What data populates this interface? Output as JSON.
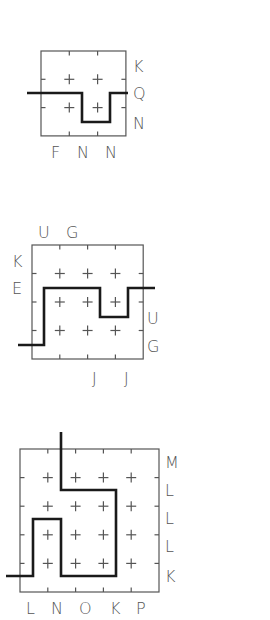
{
  "puzzles": [
    {
      "id": "puzzle-1",
      "grid": {
        "x": 41,
        "y": 51,
        "cols": 3,
        "rows": 3,
        "cell_w": 28.3,
        "cell_h": 28.3
      },
      "path": [
        [
          27,
          93
        ],
        [
          82,
          93
        ],
        [
          82,
          122
        ],
        [
          110,
          122
        ],
        [
          110,
          93
        ],
        [
          128,
          93
        ]
      ],
      "labels": {
        "top": [],
        "left": [],
        "right": [
          {
            "text": "K",
            "x": 133,
            "y": 72
          },
          {
            "text": "Q",
            "x": 133,
            "y": 99
          },
          {
            "text": "N",
            "x": 133,
            "y": 129
          }
        ],
        "bottom": [
          {
            "text": "F",
            "x": 51,
            "y": 158
          },
          {
            "text": "N",
            "x": 77,
            "y": 158
          },
          {
            "text": "N",
            "x": 105,
            "y": 158
          }
        ]
      }
    },
    {
      "id": "puzzle-2",
      "grid": {
        "x": 32,
        "y": 245,
        "cols": 4,
        "rows": 4,
        "cell_w": 27.8,
        "cell_h": 28.5
      },
      "path": [
        [
          18,
          345
        ],
        [
          44,
          345
        ],
        [
          44,
          288
        ],
        [
          100,
          288
        ],
        [
          100,
          317
        ],
        [
          128,
          317
        ],
        [
          128,
          288
        ],
        [
          155,
          288
        ]
      ],
      "labels": {
        "top": [
          {
            "text": "U",
            "x": 38,
            "y": 238
          },
          {
            "text": "G",
            "x": 66,
            "y": 238
          }
        ],
        "left": [
          {
            "text": "K",
            "x": 12,
            "y": 267
          },
          {
            "text": "E",
            "x": 12,
            "y": 294
          }
        ],
        "right": [
          {
            "text": "U",
            "x": 147,
            "y": 324
          },
          {
            "text": "G",
            "x": 147,
            "y": 352
          }
        ],
        "bottom": [
          {
            "text": "J",
            "x": 92,
            "y": 384
          },
          {
            "text": "J",
            "x": 124,
            "y": 384
          }
        ]
      }
    },
    {
      "id": "puzzle-3",
      "grid": {
        "x": 20,
        "y": 449,
        "cols": 5,
        "rows": 5,
        "cell_w": 27.8,
        "cell_h": 28.6
      },
      "path": [
        [
          61,
          432
        ],
        [
          61,
          490
        ],
        [
          116,
          490
        ],
        [
          116,
          576
        ],
        [
          61,
          576
        ],
        [
          61,
          519
        ],
        [
          33,
          519
        ],
        [
          33,
          576
        ],
        [
          6,
          576
        ]
      ],
      "labels": {
        "top": [],
        "left": [],
        "right": [
          {
            "text": "M",
            "x": 165,
            "y": 468
          },
          {
            "text": "L",
            "x": 165,
            "y": 496
          },
          {
            "text": "L",
            "x": 165,
            "y": 524
          },
          {
            "text": "L",
            "x": 165,
            "y": 552
          },
          {
            "text": "K",
            "x": 165,
            "y": 582
          }
        ],
        "bottom": [
          {
            "text": "L",
            "x": 26,
            "y": 614
          },
          {
            "text": "N",
            "x": 51,
            "y": 614
          },
          {
            "text": "O",
            "x": 79,
            "y": 614
          },
          {
            "text": "K",
            "x": 110,
            "y": 614
          },
          {
            "text": "P",
            "x": 136,
            "y": 614
          }
        ]
      }
    }
  ]
}
